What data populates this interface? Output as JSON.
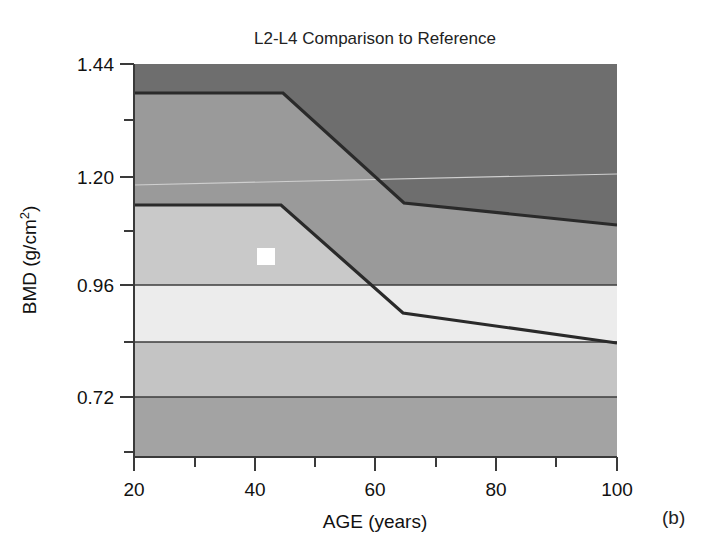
{
  "figure": {
    "title": "L2-L4 Comparison to Reference",
    "panel_label": "(b)",
    "background": "#ffffff"
  },
  "chart_data": {
    "type": "area",
    "title": "L2-L4 Comparison to Reference",
    "xlabel": "AGE (years)",
    "ylabel": "BMD (g/cm²)",
    "xlim": [
      20,
      100
    ],
    "ylim": [
      0.325,
      1.47
    ],
    "grid": false,
    "legend": null,
    "x_ticks": [
      20,
      40,
      60,
      80,
      100
    ],
    "x_tick_labels": [
      "20",
      "40",
      "60",
      "80",
      "100"
    ],
    "x_minor_ticks": [
      30,
      50,
      70,
      90
    ],
    "y_ticks": [
      1.44,
      1.2,
      0.96,
      0.72
    ],
    "y_tick_labels": [
      "1.44",
      "1.20",
      "0.96",
      "0.72"
    ],
    "y_minor_ticks": [
      1.32,
      1.08,
      0.84,
      0.6
    ],
    "bands": [
      {
        "name": "above-reference-upper",
        "description": "Dark grey region above the upper reference boundary",
        "color": "#6e6e6e",
        "boundary_label": "upper"
      },
      {
        "name": "reference-range",
        "description": "Mid grey reference range between upper and lower boundary curves",
        "color": "#9a9a9a",
        "boundary_label": "middle"
      },
      {
        "name": "below-reference-lower",
        "description": "Light region below the lower reference boundary curve",
        "color": "#d6d6d6",
        "boundary_label": "lower"
      }
    ],
    "series": [
      {
        "name": "upper reference boundary (+2 SD)",
        "x": [
          20,
          45,
          65,
          100
        ],
        "values": [
          1.38,
          1.38,
          1.15,
          1.08
        ]
      },
      {
        "name": "lower reference boundary (mean / -SD)",
        "x": [
          20,
          45,
          65,
          100
        ],
        "values": [
          1.11,
          1.11,
          0.92,
          0.84
        ]
      }
    ],
    "horizontal_reference_lines": [
      {
        "name": "ref-0.96",
        "y": 0.96
      },
      {
        "name": "ref-0.84",
        "y": 0.84
      },
      {
        "name": "ref-0.72",
        "y": 0.72
      }
    ],
    "shade_levels": [
      {
        "name": "darkest",
        "color": "#6e6e6e"
      },
      {
        "name": "mid",
        "color": "#9a9a9a"
      },
      {
        "name": "light",
        "color": "#c9c9c9"
      },
      {
        "name": "lightest",
        "color": "#ececec"
      },
      {
        "name": "pale",
        "color": "#b9b9b9"
      }
    ],
    "markers": [
      {
        "name": "patient-measurement",
        "shape": "square",
        "color": "#ffffff",
        "x": 42,
        "y": 1.055
      }
    ]
  },
  "plot_geometry": {
    "left_px": 134,
    "right_px": 617,
    "top_px": 64,
    "bottom_px": 457
  }
}
